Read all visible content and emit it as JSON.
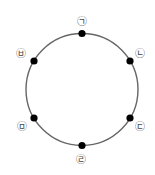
{
  "diagram": {
    "type": "circle-with-points",
    "circle": {
      "cx": 82,
      "cy": 89.5,
      "r": 56,
      "stroke": "#666666"
    },
    "dot_color": "#000000",
    "points": [
      {
        "id": "p1",
        "label": "㉠",
        "x": 82,
        "y": 33.5,
        "lx": 82,
        "ly": 21
      },
      {
        "id": "p2",
        "label": "㉡",
        "x": 130,
        "y": 61,
        "lx": 140,
        "ly": 53
      },
      {
        "id": "p3",
        "label": "㉢",
        "x": 130,
        "y": 118,
        "lx": 140,
        "ly": 126
      },
      {
        "id": "p4",
        "label": "㉣",
        "x": 82,
        "y": 145.5,
        "lx": 81,
        "ly": 159
      },
      {
        "id": "p5",
        "label": "㉤",
        "x": 34,
        "y": 118,
        "lx": 22,
        "ly": 126
      },
      {
        "id": "p6",
        "label": "㉥",
        "x": 34,
        "y": 61,
        "lx": 21,
        "ly": 53
      }
    ]
  }
}
